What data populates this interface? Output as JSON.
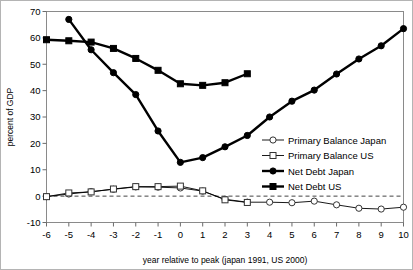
{
  "chart_data": {
    "type": "line",
    "title": "",
    "xlabel": "year relative to peak (japan 1991, US 2000)",
    "ylabel": "percent of GDP",
    "xlim": [
      -6,
      10
    ],
    "ylim": [
      -10,
      70
    ],
    "xticks": [
      -6,
      -5,
      -4,
      -3,
      -2,
      -1,
      0,
      1,
      2,
      3,
      4,
      5,
      6,
      7,
      8,
      9,
      10
    ],
    "yticks": [
      -10,
      0,
      10,
      20,
      30,
      40,
      50,
      60,
      70
    ],
    "xtick_labels": [
      "-6",
      "-5",
      "-4",
      "-3",
      "-2",
      "-1",
      "0",
      "1",
      "2",
      "3",
      "4",
      "5",
      "6",
      "7",
      "8",
      "9",
      "10"
    ],
    "ytick_labels": [
      "-10",
      "0",
      "10",
      "20",
      "30",
      "40",
      "50",
      "60",
      "70"
    ],
    "grid": false,
    "legend_position": "center-right",
    "zero_line": 0,
    "series": [
      {
        "name": "Primary Balance Japan",
        "marker": "open-circle",
        "x": [
          -6,
          -5,
          -4,
          -3,
          -2,
          -1,
          0,
          1,
          2,
          3,
          4,
          5,
          6,
          7,
          8,
          9,
          10
        ],
        "values": [
          -0.2,
          0.8,
          1.7,
          2.6,
          3.5,
          3.4,
          3.1,
          1.9,
          -1.2,
          -2.3,
          -2.3,
          -2.5,
          -1.9,
          -3.3,
          -4.6,
          -4.9,
          -4.2
        ]
      },
      {
        "name": "Primary Balance US",
        "marker": "open-square",
        "x": [
          -6,
          -5,
          -4,
          -3,
          -2,
          -1,
          0,
          1,
          2,
          3
        ],
        "values": [
          -0.2,
          1.2,
          1.6,
          2.7,
          3.6,
          3.6,
          3.8,
          2.0,
          -1.4,
          -2.4
        ]
      },
      {
        "name": "Net Debt Japan",
        "marker": "filled-circle",
        "x": [
          -5,
          -4,
          -3,
          -2,
          -1,
          0,
          1,
          2,
          3,
          4,
          5,
          6,
          7,
          8,
          9,
          10
        ],
        "values": [
          67.0,
          55.5,
          46.8,
          38.5,
          24.7,
          12.8,
          14.6,
          18.7,
          23.0,
          30.0,
          36.0,
          40.2,
          46.3,
          52.0,
          57.0,
          63.5
        ]
      },
      {
        "name": "Net Debt US",
        "marker": "filled-square",
        "x": [
          -6,
          -5,
          -4,
          -3,
          -2,
          -1,
          0,
          1,
          2,
          3
        ],
        "values": [
          59.3,
          58.9,
          58.4,
          56.0,
          52.2,
          47.7,
          42.6,
          42.0,
          43.0,
          46.4
        ]
      }
    ]
  }
}
